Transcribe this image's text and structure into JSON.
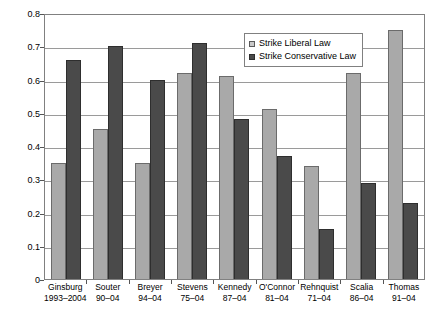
{
  "chart_data": {
    "type": "bar",
    "title": "",
    "subtitle": "",
    "xlabel": "",
    "ylabel": "",
    "ylim": [
      0,
      0.8
    ],
    "ytick_values": [
      0,
      0.1,
      0.2,
      0.3,
      0.4,
      0.5,
      0.6,
      0.7,
      0.8
    ],
    "ytick_labels": [
      "0",
      "0.1",
      "0.2",
      "0.3",
      "0.4",
      "0.5",
      "0.6",
      "0.7",
      "0.8"
    ],
    "grid": true,
    "legend_position": "top-right",
    "categories": [
      {
        "name": "Ginsburg",
        "years": "1993–2004"
      },
      {
        "name": "Souter",
        "years": "90–04"
      },
      {
        "name": "Breyer",
        "years": "94–04"
      },
      {
        "name": "Stevens",
        "years": "75–04"
      },
      {
        "name": "Kennedy",
        "years": "87–04"
      },
      {
        "name": "O'Connor",
        "years": "81–04"
      },
      {
        "name": "Rehnquist",
        "years": "71–04"
      },
      {
        "name": "Scalia",
        "years": "86–04"
      },
      {
        "name": "Thomas",
        "years": "91–04"
      }
    ],
    "series": [
      {
        "name": "Strike Liberal Law",
        "color": "#a9a9a9",
        "values": [
          0.35,
          0.45,
          0.35,
          0.62,
          0.61,
          0.51,
          0.34,
          0.62,
          0.75
        ]
      },
      {
        "name": "Strike Conservative Law",
        "color": "#4a4a4a",
        "values": [
          0.66,
          0.7,
          0.6,
          0.71,
          0.48,
          0.37,
          0.15,
          0.29,
          0.23
        ]
      }
    ]
  }
}
